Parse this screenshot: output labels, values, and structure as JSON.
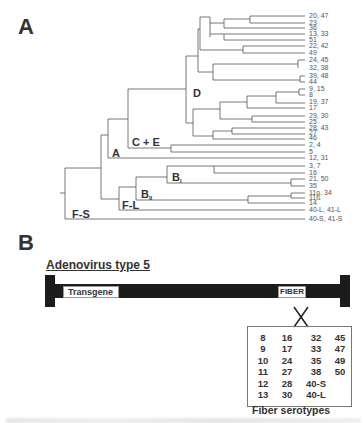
{
  "panel_a": {
    "letter": "A",
    "clades": {
      "D": "D",
      "CE": "C + E",
      "A": "A",
      "BI_main": "B",
      "BI_sub": "I",
      "BII_main": "B",
      "BII_sub": "II",
      "FL": "F-L",
      "FS": "F-S"
    },
    "leaves": [
      "20, 47",
      "23",
      "36",
      "13, 33",
      "51",
      "22, 42",
      "49",
      "24, 45",
      "32, 38",
      "39, 48",
      "44",
      "9, 15",
      "8",
      "19, 37",
      "17",
      "29, 30",
      "25",
      "28, 43",
      "27",
      "46",
      "2, 4",
      "5",
      "12, 31",
      "3, 7",
      "16",
      "21, 50",
      "35",
      "11p, 34",
      "11ß",
      "14",
      "40-L, 41-L",
      "40-S, 41-S"
    ]
  },
  "panel_b": {
    "letter": "B",
    "title": "Adenovirus type 5",
    "transgene_label": "Transgene",
    "fiber_label": "FIBER",
    "serotype_columns": [
      [
        "8",
        "9",
        "10",
        "11",
        "12",
        "13"
      ],
      [
        "16",
        "17",
        "24",
        "27",
        "28",
        "30"
      ],
      [
        "32",
        "33",
        "35",
        "38",
        "40-S",
        "40-L"
      ],
      [
        "45",
        "47",
        "49",
        "50"
      ]
    ],
    "serotype_caption": "Fiber serotypes"
  }
}
